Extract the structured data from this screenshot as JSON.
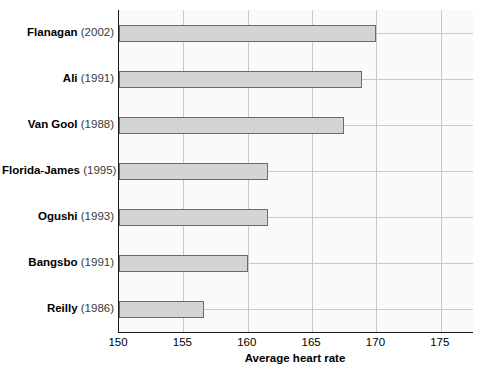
{
  "chart_data": {
    "type": "bar",
    "orientation": "horizontal",
    "title": "",
    "xlabel": "Average heart rate",
    "ylabel": "",
    "xlim": [
      150,
      177.5
    ],
    "ylim": [],
    "grid": true,
    "legend": null,
    "xticks": [
      150,
      155,
      160,
      165,
      170,
      175
    ],
    "xticklabels": [
      "150",
      "155",
      "160",
      "165",
      "170",
      "175"
    ],
    "categories": [
      "Flanagan (2002)",
      "Ali (1991)",
      "Van Gool (1988)",
      "Florida-James (1995)",
      "Ogushi (1993)",
      "Bangsbo (1991)",
      "Reilly (1986)"
    ],
    "values": [
      170.0,
      168.9,
      167.5,
      161.6,
      161.6,
      160.0,
      156.6
    ],
    "bars": [
      {
        "author": "Flanagan",
        "year": "(2002)",
        "value": 170.0
      },
      {
        "author": "Ali",
        "year": "(1991)",
        "value": 168.9
      },
      {
        "author": "Van Gool",
        "year": "(1988)",
        "value": 167.5
      },
      {
        "author": "Florida-James",
        "year": "(1995)",
        "value": 161.6
      },
      {
        "author": "Ogushi",
        "year": "(1993)",
        "value": 161.6
      },
      {
        "author": "Bangsbo",
        "year": "(1991)",
        "value": 160.0
      },
      {
        "author": "Reilly",
        "year": "(1986)",
        "value": 156.6
      }
    ],
    "colors": {
      "bar_fill": "#d4d4d4",
      "bar_border": "#6b6b6b",
      "grid": "#c8c8c8",
      "axis": "#1a1a1a",
      "plot_background": "#fafafa",
      "text": "#000000"
    }
  }
}
